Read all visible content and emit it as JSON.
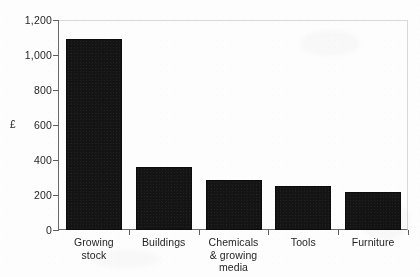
{
  "chart_data": {
    "type": "bar",
    "title": "",
    "subtitle": "",
    "xlabel": "",
    "ylabel": "£",
    "ylim": [
      0,
      1200
    ],
    "grid": false,
    "legend": false,
    "categories": [
      "Growing\nstock",
      "Buildings",
      "Chemicals\n& growing\nmedia",
      "Tools",
      "Furniture"
    ],
    "values": [
      1090,
      360,
      285,
      250,
      215
    ],
    "y_ticks": [
      0,
      200,
      400,
      600,
      800,
      1000,
      1200
    ],
    "y_tick_labels": [
      "0",
      "200",
      "400",
      "600",
      "800",
      "1,000",
      "1,200"
    ]
  },
  "axis": {
    "y_label": "£"
  }
}
